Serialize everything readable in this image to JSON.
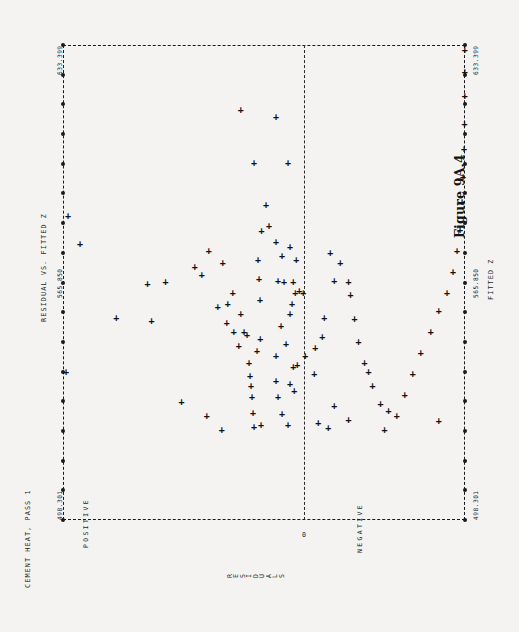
{
  "page": {
    "background": "#f4f3f1",
    "ink": "#1a1a1a"
  },
  "header": {
    "dataset_title": "CEMENT HEAT, PASS 1",
    "plot_title": "RESIDUAL VS. FITTED Z",
    "figure_caption": "Figure 9A.4"
  },
  "axes": {
    "vertical_axis_label": "FITTED Z",
    "horizontal_axis_label": "RESIDUALS",
    "y_ticks": [
      "633.399",
      "565.850",
      "498.301"
    ],
    "y_tick_top": "633.399",
    "y_tick_mid": "565.850",
    "y_tick_bottom": "498.301",
    "x_zero_label": "0",
    "x_left_category": "POSITIVE",
    "x_right_category": "NEGATIVE"
  },
  "chart_data": {
    "type": "scatter",
    "title": "RESIDUAL VS. FITTED Z",
    "subtitle": "CEMENT HEAT, PASS 1",
    "caption": "Figure 9A.4",
    "xlabel": "RESIDUALS",
    "ylabel": "FITTED Z",
    "marker": "+",
    "grid": false,
    "orientation": "rotated-90",
    "legend": "none",
    "xlim": [
      -1,
      1
    ],
    "ylim": [
      498.301,
      633.399
    ],
    "yticks": [
      498.301,
      565.85,
      633.399
    ],
    "x_zero_line": 0,
    "x_categories": [
      "POSITIVE",
      "NEGATIVE"
    ],
    "n_points": 105,
    "note": "x stored as normalized residual (negative = POSITIVE side at left, positive = NEGATIVE side at right); y stored as FITTED Z value",
    "points": [
      {
        "x": -0.975,
        "y": 585.0
      },
      {
        "x": -0.915,
        "y": 577.0
      },
      {
        "x": -0.49,
        "y": 566.0
      },
      {
        "x": -0.735,
        "y": 556.0
      },
      {
        "x": -0.56,
        "y": 555.0
      },
      {
        "x": -0.58,
        "y": 565.5
      },
      {
        "x": -0.345,
        "y": 570.5
      },
      {
        "x": -0.31,
        "y": 568.0
      },
      {
        "x": -0.275,
        "y": 575.0
      },
      {
        "x": -0.23,
        "y": 559.0
      },
      {
        "x": -0.205,
        "y": 571.5
      },
      {
        "x": -0.185,
        "y": 554.5
      },
      {
        "x": -0.18,
        "y": 560.0
      },
      {
        "x": -0.155,
        "y": 563.0
      },
      {
        "x": -0.15,
        "y": 552.0
      },
      {
        "x": -0.125,
        "y": 548.0
      },
      {
        "x": -0.115,
        "y": 557.0
      },
      {
        "x": -0.1,
        "y": 552.0
      },
      {
        "x": -0.085,
        "y": 551.0
      },
      {
        "x": -0.075,
        "y": 543.0
      },
      {
        "x": -0.07,
        "y": 539.5
      },
      {
        "x": -0.065,
        "y": 536.5
      },
      {
        "x": -0.06,
        "y": 533.5
      },
      {
        "x": -0.055,
        "y": 529.0
      },
      {
        "x": -0.05,
        "y": 525.0
      },
      {
        "x": -0.035,
        "y": 546.5
      },
      {
        "x": -0.03,
        "y": 572.5
      },
      {
        "x": -0.025,
        "y": 567.0
      },
      {
        "x": -0.02,
        "y": 561.0
      },
      {
        "x": -0.018,
        "y": 550.0
      },
      {
        "x": -0.015,
        "y": 525.5
      },
      {
        "x": -0.012,
        "y": 580.5
      },
      {
        "x": -0.41,
        "y": 532.0
      },
      {
        "x": -0.285,
        "y": 528.0
      },
      {
        "x": -0.21,
        "y": 524.0
      },
      {
        "x": -0.05,
        "y": 600.0
      },
      {
        "x": -0.115,
        "y": 615.0
      },
      {
        "x": -0.985,
        "y": 540.5
      },
      {
        "x": 0.01,
        "y": 588.0
      },
      {
        "x": 0.025,
        "y": 582.0
      },
      {
        "x": 0.06,
        "y": 577.5
      },
      {
        "x": 0.09,
        "y": 573.5
      },
      {
        "x": 0.13,
        "y": 576.0
      },
      {
        "x": 0.16,
        "y": 572.5
      },
      {
        "x": 0.07,
        "y": 566.5
      },
      {
        "x": 0.1,
        "y": 566.0
      },
      {
        "x": 0.145,
        "y": 566.0
      },
      {
        "x": 0.155,
        "y": 563.0
      },
      {
        "x": 0.175,
        "y": 563.5
      },
      {
        "x": 0.195,
        "y": 563.0
      },
      {
        "x": 0.14,
        "y": 560.0
      },
      {
        "x": 0.13,
        "y": 557.0
      },
      {
        "x": 0.085,
        "y": 553.5
      },
      {
        "x": 0.11,
        "y": 548.5
      },
      {
        "x": 0.06,
        "y": 545.0
      },
      {
        "x": 0.145,
        "y": 542.0
      },
      {
        "x": 0.165,
        "y": 542.5
      },
      {
        "x": 0.205,
        "y": 545.0
      },
      {
        "x": 0.06,
        "y": 538.0
      },
      {
        "x": 0.13,
        "y": 537.0
      },
      {
        "x": 0.15,
        "y": 535.0
      },
      {
        "x": 0.07,
        "y": 533.5
      },
      {
        "x": 0.25,
        "y": 540.0
      },
      {
        "x": 0.255,
        "y": 547.5
      },
      {
        "x": 0.29,
        "y": 550.5
      },
      {
        "x": 0.3,
        "y": 556.0
      },
      {
        "x": 0.33,
        "y": 574.5
      },
      {
        "x": 0.35,
        "y": 566.5
      },
      {
        "x": 0.38,
        "y": 571.5
      },
      {
        "x": 0.42,
        "y": 566.0
      },
      {
        "x": 0.43,
        "y": 562.5
      },
      {
        "x": 0.45,
        "y": 555.5
      },
      {
        "x": 0.47,
        "y": 549.0
      },
      {
        "x": 0.5,
        "y": 543.0
      },
      {
        "x": 0.52,
        "y": 540.5
      },
      {
        "x": 0.54,
        "y": 536.5
      },
      {
        "x": 0.58,
        "y": 531.5
      },
      {
        "x": 0.62,
        "y": 529.5
      },
      {
        "x": 0.66,
        "y": 528.0
      },
      {
        "x": 0.7,
        "y": 534.0
      },
      {
        "x": 0.74,
        "y": 540.0
      },
      {
        "x": 0.78,
        "y": 546.0
      },
      {
        "x": 0.83,
        "y": 552.0
      },
      {
        "x": 0.87,
        "y": 558.0
      },
      {
        "x": 0.91,
        "y": 563.0
      },
      {
        "x": 0.94,
        "y": 569.0
      },
      {
        "x": 0.96,
        "y": 575.0
      },
      {
        "x": 0.975,
        "y": 581.0
      },
      {
        "x": 0.985,
        "y": 589.0
      },
      {
        "x": 0.99,
        "y": 596.0
      },
      {
        "x": 0.995,
        "y": 604.0
      },
      {
        "x": 0.998,
        "y": 611.0
      },
      {
        "x": 0.999,
        "y": 619.0
      },
      {
        "x": 0.999,
        "y": 626.0
      },
      {
        "x": 0.999,
        "y": 632.0
      },
      {
        "x": 0.12,
        "y": 600.0
      },
      {
        "x": 0.06,
        "y": 613.0
      },
      {
        "x": 0.27,
        "y": 526.0
      },
      {
        "x": 0.32,
        "y": 524.5
      },
      {
        "x": 0.42,
        "y": 527.0
      },
      {
        "x": 0.6,
        "y": 524.0
      },
      {
        "x": 0.12,
        "y": 525.5
      },
      {
        "x": 0.09,
        "y": 528.5
      },
      {
        "x": 0.35,
        "y": 531.0
      },
      {
        "x": 0.87,
        "y": 526.5
      }
    ]
  }
}
